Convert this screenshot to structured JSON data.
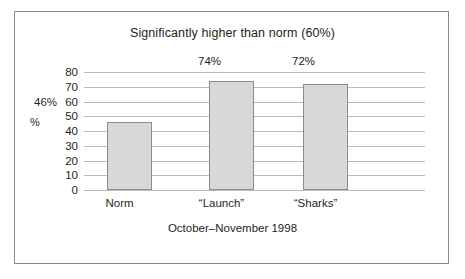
{
  "chart_data": {
    "type": "bar",
    "title": "Significantly higher than norm (60%)",
    "xlabel": "October–November 1998",
    "ylabel": "%",
    "categories": [
      "Norm",
      "“Launch”",
      "“Sharks”"
    ],
    "values": [
      46,
      74,
      72
    ],
    "value_labels": [
      "46%",
      "74%",
      "72%"
    ],
    "ylim": [
      0,
      80
    ],
    "yticks": [
      80,
      70,
      60,
      50,
      40,
      30,
      20,
      10,
      0
    ],
    "ytick_labels": [
      "80",
      "70",
      "60",
      "50",
      "40",
      "30",
      "20",
      "10",
      "0"
    ],
    "grid": true,
    "legend": "none",
    "series": [
      {
        "name": "Percentage",
        "values": [
          46,
          74,
          72
        ]
      }
    ],
    "colors": {
      "bar_fill": "#d8d8d8",
      "bar_border": "#8c8c8c",
      "gridline": "#b9bcc0",
      "text": "#231f20",
      "frame": "#8a8a8a",
      "background": "#ffffff"
    }
  }
}
